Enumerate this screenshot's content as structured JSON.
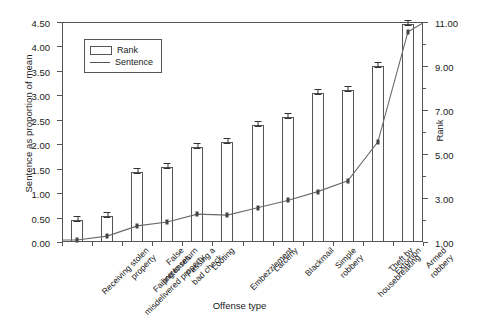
{
  "chart_data": {
    "type": "bar",
    "title": "",
    "xlabel": "Offense type",
    "ylabel": "Sentence as proportion of mean",
    "ylabel_right": "Rank",
    "ylim": [
      0.0,
      4.5
    ],
    "ytick_step": 0.5,
    "ylim_right": [
      1.0,
      11.0
    ],
    "ytick_step_right": 2.0,
    "grid": false,
    "legend_position": "upper-left-inside",
    "categories": [
      "Receiving stolen\nproperty",
      "Failing to return\nmisdelivered property",
      "False\npretenses",
      "Passing a\nbad check",
      "Looting",
      "Embezzlement",
      "Larceny",
      "Blackmail",
      "Simple\nrobbery",
      "Theft by\nhousebreaking",
      "Extortion",
      "Armed\nrobbery"
    ],
    "series": [
      {
        "name": "Rank",
        "type": "bar",
        "axis": "left",
        "values": [
          0.46,
          0.53,
          1.44,
          1.53,
          1.95,
          2.05,
          2.4,
          2.55,
          3.05,
          3.11,
          3.61,
          4.45
        ],
        "rank_axis_values": [
          1.0,
          1.2,
          3.2,
          3.4,
          4.3,
          4.6,
          5.3,
          5.7,
          6.8,
          6.9,
          8.0,
          9.9
        ],
        "error_bars": [
          0.04,
          0.04,
          0.04,
          0.04,
          0.04,
          0.04,
          0.04,
          0.05,
          0.04,
          0.04,
          0.04,
          0.05
        ]
      },
      {
        "name": "Sentence",
        "type": "line",
        "axis": "left",
        "values": [
          0.04,
          0.12,
          0.33,
          0.41,
          0.57,
          0.55,
          0.7,
          0.85,
          1.03,
          1.25,
          2.05,
          4.3
        ],
        "error_bars": [
          0.04,
          0.04,
          0.04,
          0.04,
          0.04,
          0.04,
          0.04,
          0.04,
          0.04,
          0.04,
          0.04,
          0.05
        ]
      }
    ],
    "ytick_labels_left": [
      "0.00",
      "0.50",
      "1.00",
      "1.50",
      "2.00",
      "2.50",
      "3.00",
      "3.50",
      "4.00",
      "4.50"
    ],
    "ytick_labels_right": [
      "1.00",
      "3.00",
      "5.00",
      "7.00",
      "9.00",
      "11.00"
    ]
  },
  "legend": {
    "entries": [
      {
        "label": "Rank",
        "swatch": "bar"
      },
      {
        "label": "Sentence",
        "swatch": "line"
      }
    ]
  },
  "axes": {
    "left_title": "Sentence as proportion of mean",
    "right_title": "Rank",
    "bottom_title": "Offense type"
  }
}
